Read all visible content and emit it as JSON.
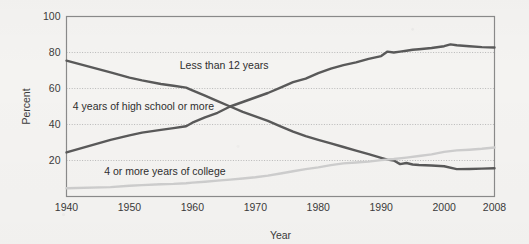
{
  "figure": {
    "background_color": "#f4f3f1",
    "plot_frame_color": "#8a8a8a",
    "gridline_color": "#b9b9b9"
  },
  "chart_data": {
    "type": "line",
    "title": "",
    "xlabel": "Year",
    "ylabel": "Percent",
    "xlim": [
      1940,
      2008
    ],
    "ylim": [
      0,
      100
    ],
    "grid": "horizontal dotted gridlines at 20, 40, 60, 80, 100",
    "legend": "inline labels placed next to each curve",
    "xticks": [
      "1940",
      "1950",
      "1960",
      "1970",
      "1980",
      "1990",
      "2000",
      "2008"
    ],
    "xtick_values": [
      1940,
      1950,
      1960,
      1970,
      1980,
      1990,
      2000,
      2008
    ],
    "yticks": [
      "20",
      "40",
      "60",
      "80",
      "100"
    ],
    "ytick_values": [
      20,
      40,
      60,
      80,
      100
    ],
    "series": [
      {
        "name": "Less than 12 years",
        "color": "#595959",
        "label_x": 1958,
        "label_y": 71,
        "x": [
          1940,
          1947,
          1950,
          1952,
          1955,
          1957,
          1959,
          1960,
          1962,
          1964,
          1966,
          1968,
          1970,
          1972,
          1974,
          1976,
          1978,
          1980,
          1982,
          1984,
          1986,
          1988,
          1990,
          1991,
          1992,
          1993,
          1994,
          1995,
          1996,
          1998,
          2000,
          2002,
          2004,
          2006,
          2008
        ],
        "values": [
          75.5,
          69.0,
          66.0,
          64.5,
          62.5,
          61.5,
          60.5,
          59.0,
          56.0,
          53.0,
          50.0,
          47.0,
          44.5,
          42.0,
          39.0,
          36.0,
          33.5,
          31.5,
          29.5,
          27.5,
          25.5,
          23.5,
          21.5,
          20.5,
          20.0,
          18.0,
          18.6,
          17.8,
          17.5,
          17.2,
          16.8,
          15.2,
          15.3,
          15.5,
          15.7
        ]
      },
      {
        "name": "4 years of high school or more",
        "color": "#595959",
        "label_x": 1941,
        "label_y": 48,
        "x": [
          1940,
          1947,
          1950,
          1952,
          1955,
          1957,
          1959,
          1960,
          1962,
          1964,
          1966,
          1968,
          1970,
          1972,
          1974,
          1976,
          1978,
          1980,
          1982,
          1984,
          1986,
          1988,
          1990,
          1991,
          1992,
          1993,
          1994,
          1995,
          1996,
          1998,
          2000,
          2001,
          2002,
          2004,
          2006,
          2008
        ],
        "values": [
          24.5,
          31.5,
          34.0,
          35.5,
          37.0,
          38.0,
          39.0,
          41.0,
          44.0,
          46.5,
          50.0,
          52.5,
          55.0,
          57.5,
          60.5,
          63.5,
          65.5,
          68.5,
          71.0,
          73.0,
          74.5,
          76.5,
          78.0,
          80.5,
          80.0,
          80.5,
          81.0,
          81.5,
          81.8,
          82.5,
          83.5,
          84.5,
          84.0,
          83.5,
          83.0,
          82.8
        ]
      },
      {
        "name": "4 or more years of college",
        "color": "#cdcdcd",
        "label_x": 1946,
        "label_y": 12,
        "x": [
          1940,
          1947,
          1950,
          1952,
          1955,
          1957,
          1959,
          1960,
          1962,
          1964,
          1966,
          1968,
          1970,
          1972,
          1974,
          1976,
          1978,
          1980,
          1982,
          1984,
          1986,
          1988,
          1990,
          1992,
          1994,
          1996,
          1998,
          2000,
          2002,
          2004,
          2006,
          2008
        ],
        "values": [
          4.6,
          5.2,
          6.0,
          6.3,
          6.8,
          7.0,
          7.4,
          7.7,
          8.2,
          8.8,
          9.4,
          10.0,
          10.7,
          11.6,
          12.8,
          14.0,
          15.2,
          16.2,
          17.4,
          18.4,
          18.9,
          19.4,
          20.2,
          20.8,
          21.6,
          22.5,
          23.4,
          24.8,
          25.6,
          26.0,
          26.5,
          27.2
        ]
      }
    ]
  }
}
